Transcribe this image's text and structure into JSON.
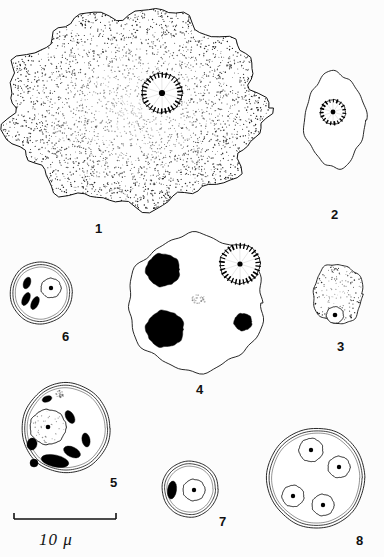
{
  "plate": {
    "title": "Entamoeba trophozoites and cysts plate",
    "background_color": "#fcfcfc",
    "ink_color": "#111111",
    "width": 384,
    "height": 557
  },
  "scale_bar": {
    "label": "10 μ",
    "length_px": 102,
    "x": 14,
    "y": 519
  },
  "figures": [
    {
      "number": "1",
      "label_x": 95,
      "label_y": 222,
      "caption": "Large stippled amoeba trophozoite with single nucleus",
      "body": {
        "cx": 135,
        "cy": 108,
        "rx": 128,
        "ry": 97,
        "fill": "#ffffff",
        "stipple": true,
        "lobed": true
      },
      "nuclei": [
        {
          "cx": 162,
          "cy": 93,
          "r": 20,
          "karyosome_r": 3.1,
          "peripheral_chromatin": true
        }
      ],
      "chromatoids": [],
      "inclusions": []
    },
    {
      "number": "2",
      "label_x": 331,
      "label_y": 208,
      "caption": "Smaller elongate amoeba trophozoite with single nucleus",
      "body": {
        "cx": 335,
        "cy": 120,
        "rx": 30,
        "ry": 47,
        "fill": "#ffffff",
        "stipple": false,
        "lobed": true
      },
      "nuclei": [
        {
          "cx": 333,
          "cy": 112,
          "r": 12.5,
          "karyosome_r": 2.4,
          "peripheral_chromatin": true
        }
      ],
      "chromatoids": [],
      "inclusions": []
    },
    {
      "number": "3",
      "label_x": 337,
      "label_y": 340,
      "caption": "Small stippled trophozoite, eccentric nucleus",
      "body": {
        "cx": 338,
        "cy": 294,
        "rx": 25,
        "ry": 30,
        "fill": "#ffffff",
        "stipple": true,
        "lobed": true
      },
      "nuclei": [
        {
          "cx": 335,
          "cy": 315,
          "r": 8.5,
          "karyosome_r": 2.3,
          "peripheral_chromatin": false
        }
      ],
      "chromatoids": [],
      "inclusions": []
    },
    {
      "number": "4",
      "label_x": 196,
      "label_y": 383,
      "caption": "Large trophozoite with nucleus, three ingested erythrocytes and a vacuole",
      "body": {
        "cx": 196,
        "cy": 303,
        "rx": 68,
        "ry": 68,
        "fill": "#ffffff",
        "stipple": false,
        "lobed": true
      },
      "nuclei": [
        {
          "cx": 240,
          "cy": 264,
          "r": 20,
          "karyosome_r": 2.6,
          "peripheral_chromatin": true
        }
      ],
      "chromatoids": [],
      "inclusions": [
        {
          "cx": 163,
          "cy": 270,
          "r": 17,
          "fill": "#000000",
          "kind": "ingested-erythrocyte"
        },
        {
          "cx": 165,
          "cy": 329,
          "r": 19,
          "fill": "#000000",
          "kind": "ingested-erythrocyte"
        },
        {
          "cx": 243,
          "cy": 322,
          "r": 9,
          "fill": "#000000",
          "kind": "ingested-erythrocyte"
        },
        {
          "cx": 199,
          "cy": 300,
          "r": 7,
          "fill": "none",
          "kind": "vacuole"
        }
      ]
    },
    {
      "number": "5",
      "label_x": 110,
      "label_y": 476,
      "caption": "Young cyst with single large nucleus and many chromatoid bodies",
      "body": {
        "cx": 66,
        "cy": 428,
        "rx": 44,
        "ry": 45,
        "fill": "#ffffff",
        "stipple": false,
        "double_wall": true
      },
      "nuclei": [
        {
          "cx": 48,
          "cy": 427,
          "r": 18,
          "karyosome_r": 2.3,
          "peripheral_chromatin": false,
          "stippled_interior": true
        }
      ],
      "chromatoids": [
        {
          "cx": 47,
          "cy": 399,
          "rx": 5,
          "ry": 3,
          "rot": -20
        },
        {
          "cx": 70,
          "cy": 417,
          "rx": 7,
          "ry": 4,
          "rot": 60
        },
        {
          "cx": 32,
          "cy": 444,
          "rx": 5,
          "ry": 6,
          "rot": 10
        },
        {
          "cx": 86,
          "cy": 440,
          "rx": 4,
          "ry": 7,
          "rot": -10
        },
        {
          "cx": 72,
          "cy": 452,
          "rx": 9,
          "ry": 5,
          "rot": 25
        },
        {
          "cx": 55,
          "cy": 461,
          "rx": 14,
          "ry": 6,
          "rot": 12
        },
        {
          "cx": 34,
          "cy": 463,
          "rx": 4,
          "ry": 4,
          "rot": 0
        }
      ],
      "inclusions": [
        {
          "cx": 60,
          "cy": 394,
          "r": 4,
          "fill": "none",
          "kind": "vacuole"
        }
      ]
    },
    {
      "number": "6",
      "label_x": 62,
      "label_y": 330,
      "caption": "Uninucleate cyst with three chromatoid bodies",
      "body": {
        "cx": 41,
        "cy": 293,
        "rx": 31,
        "ry": 31,
        "fill": "#ffffff",
        "stipple": false,
        "double_wall": true
      },
      "nuclei": [
        {
          "cx": 51,
          "cy": 288,
          "r": 10,
          "karyosome_r": 2.2,
          "peripheral_chromatin": false
        }
      ],
      "chromatoids": [
        {
          "cx": 27,
          "cy": 283,
          "rx": 3.5,
          "ry": 6,
          "rot": 20
        },
        {
          "cx": 26,
          "cy": 299,
          "rx": 3.5,
          "ry": 7,
          "rot": 25
        },
        {
          "cx": 35,
          "cy": 303,
          "rx": 3.5,
          "ry": 7,
          "rot": 25
        }
      ],
      "inclusions": []
    },
    {
      "number": "7",
      "label_x": 219,
      "label_y": 515,
      "caption": "Uninucleate cyst with single elongate chromatoid body",
      "body": {
        "cx": 190,
        "cy": 489,
        "rx": 28,
        "ry": 28,
        "fill": "#ffffff",
        "stipple": false,
        "double_wall": true
      },
      "nuclei": [
        {
          "cx": 194,
          "cy": 490,
          "r": 11,
          "karyosome_r": 2.2,
          "peripheral_chromatin": false
        }
      ],
      "chromatoids": [
        {
          "cx": 172,
          "cy": 490,
          "rx": 4.5,
          "ry": 9,
          "rot": 8
        }
      ],
      "inclusions": []
    },
    {
      "number": "8",
      "label_x": 356,
      "label_y": 534,
      "caption": "Mature quadrinucleate cyst",
      "body": {
        "cx": 316,
        "cy": 478,
        "rx": 49,
        "ry": 50,
        "fill": "#ffffff",
        "stipple": false,
        "double_wall": true
      },
      "nuclei": [
        {
          "cx": 311,
          "cy": 450,
          "r": 12,
          "karyosome_r": 2.2,
          "peripheral_chromatin": false
        },
        {
          "cx": 339,
          "cy": 467,
          "r": 11,
          "karyosome_r": 2.2,
          "peripheral_chromatin": false
        },
        {
          "cx": 293,
          "cy": 496,
          "r": 11,
          "karyosome_r": 2.2,
          "peripheral_chromatin": false
        },
        {
          "cx": 323,
          "cy": 505,
          "r": 11,
          "karyosome_r": 2.2,
          "peripheral_chromatin": false
        }
      ],
      "chromatoids": [],
      "inclusions": []
    }
  ]
}
